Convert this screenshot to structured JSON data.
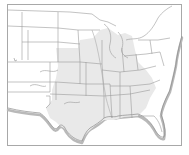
{
  "map": {
    "title": "",
    "region": "United States (central and eastern)",
    "style": "grayscale outline map",
    "highlighted_region": "central states",
    "colors": {
      "background": "#ffffff",
      "land": "#ffffff",
      "highlight": "#e9e9e9",
      "borders": "#9a9a9a",
      "frame": "#a8a8a8",
      "coast_shadow": "#b9b9b9"
    },
    "labels": []
  }
}
